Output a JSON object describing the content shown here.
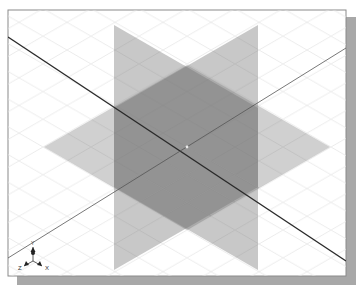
{
  "viewport": {
    "type": "3d-isometric-view",
    "frame": {
      "x": 8,
      "y": 10,
      "width": 338,
      "height": 266
    },
    "colors": {
      "background": "#ffffff",
      "frame_border": "#8a8a8a",
      "shadow": "#a6a6a6",
      "grid": "#e4e4e4",
      "plane_fill": "#6e6e6e",
      "axis_line_dark": "#2a2a2a",
      "axis_line_thin": "#555555"
    },
    "center": {
      "x": 187,
      "y": 147
    }
  },
  "planes": [
    {
      "name": "front-plane",
      "points": "114,25 258,108 258,270 114,187",
      "opacity": 0.38
    },
    {
      "name": "right-plane",
      "points": "258,25 114,108 114,270 258,187",
      "opacity": 0.38
    },
    {
      "name": "top-plane",
      "points": "44,147 187,65 330,147 187,230",
      "opacity": 0.32
    }
  ],
  "axis_lines": [
    {
      "name": "axis-line-dark",
      "x1": 8,
      "y1": 37,
      "x2": 346,
      "y2": 261,
      "width": 1.4
    },
    {
      "name": "axis-line-thin",
      "x1": 8,
      "y1": 258,
      "x2": 346,
      "y2": 48,
      "width": 0.8
    }
  ],
  "triad": {
    "origin": {
      "x": 33,
      "y": 261
    },
    "labels": {
      "x": "X",
      "y": "Y",
      "z": "Z"
    }
  }
}
